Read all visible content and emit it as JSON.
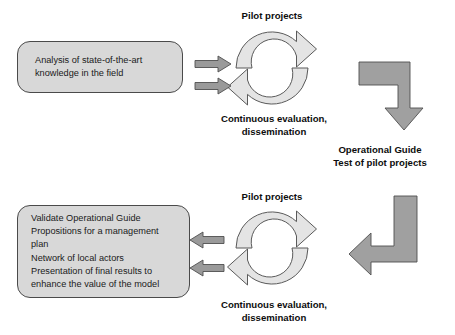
{
  "diagram": {
    "colors": {
      "box_fill": "#d8d8d8",
      "box_border": "#4a4a4a",
      "cycle_fill": "#e4e4e4",
      "cycle_stroke": "#5a5a5a",
      "connector_arrow": "#9a9a9a",
      "elbow_arrow": "#a0a0a0",
      "text": "#1a1a1a",
      "background": "#ffffff"
    }
  },
  "top_section": {
    "input_box": {
      "lines": [
        "Analysis of state-of-the-art",
        "knowledge in the field"
      ]
    },
    "cycle": {
      "top_label": "Pilot projects",
      "bottom_label_line1": "Continuous evaluation,",
      "bottom_label_line2": "dissemination"
    },
    "connector_arrows": [
      {
        "name": "arrow-analysis-to-pilot",
        "direction": "right"
      },
      {
        "name": "arrow-analysis-to-evaluation",
        "direction": "right"
      }
    ],
    "elbow_arrow": {
      "name": "elbow-arrow-down",
      "direction": "right-then-down"
    }
  },
  "middle_text": {
    "line1": "Operational Guide",
    "line2": "Test of pilot projects"
  },
  "bottom_section": {
    "outcome_box": {
      "items": [
        "Validate Operational Guide",
        "Propositions for a management",
        "plan",
        "Network of local actors",
        "Presentation of final results to",
        "enhance the value of the model"
      ]
    },
    "cycle": {
      "top_label": "Pilot projects",
      "bottom_label_line1": "Continuous evaluation,",
      "bottom_label_line2": "dissemination"
    },
    "connector_arrows": [
      {
        "name": "arrow-pilot-to-outcomes",
        "direction": "left"
      },
      {
        "name": "arrow-evaluation-to-outcomes",
        "direction": "left"
      }
    ],
    "elbow_arrow": {
      "name": "elbow-arrow-left",
      "direction": "down-then-left"
    }
  }
}
